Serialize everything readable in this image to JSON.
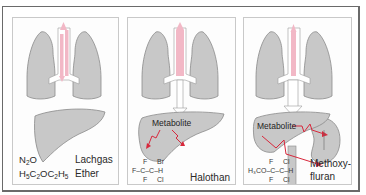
{
  "figure": {
    "colors": {
      "organ_fill": "#c8c8c8",
      "organ_stroke": "#8a8a8a",
      "airway_pink": "#f2b8c6",
      "arrow_red": "#d8283c",
      "frame": "#6a6a6a",
      "panel_border": "#c9c9c9"
    },
    "panels": [
      {
        "id": "nitrous-oxide-ether",
        "formulas": [
          {
            "parts": [
              "N",
              "2",
              "O"
            ]
          },
          {
            "parts": [
              "H",
              "5",
              "C",
              "2",
              "OC",
              "2",
              "H",
              "5"
            ]
          }
        ],
        "names": [
          "Lachgas",
          "Ether"
        ],
        "metabolite_label": null
      },
      {
        "id": "halothane",
        "structure": {
          "top": [
            "F",
            "Br"
          ],
          "middle_left": "F–C–C–H",
          "bottom": [
            "F",
            "Cl"
          ]
        },
        "name": "Halothan",
        "metabolite_label": "Metabolite"
      },
      {
        "id": "methoxyflurane",
        "structure": {
          "top": [
            "F",
            "Cl"
          ],
          "middle_left": "H₃CO–C–C–H",
          "bottom": [
            "F",
            "Cl"
          ]
        },
        "name_lines": [
          "Methoxy-",
          "fluran"
        ],
        "metabolite_label": "Metabolite"
      }
    ]
  }
}
